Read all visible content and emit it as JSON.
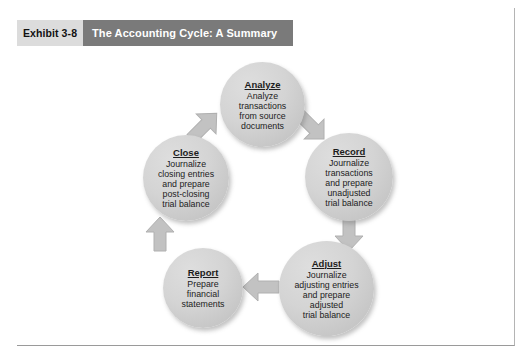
{
  "header": {
    "exhibit_label": "Exhibit 3-8",
    "title": "The Accounting Cycle: A Summary"
  },
  "colors": {
    "header_bar": "#7a7a7a",
    "exhibit_tag": "#dcdcdc",
    "circle_fill": "#d4d4d4",
    "arrow_fill": "#c0c0c0",
    "text": "#1c1c1c",
    "header_text": "#ffffff"
  },
  "diagram": {
    "type": "cycle",
    "nodes": [
      {
        "id": "analyze",
        "title": "Analyze",
        "body": "Analyze\ntransactions\nfrom source\ndocuments"
      },
      {
        "id": "record",
        "title": "Record",
        "body": "Journalize\ntransactions\nand prepare\nunadjusted\ntrial balance"
      },
      {
        "id": "adjust",
        "title": "Adjust",
        "body": "Journalize\nadjusting entries\nand prepare\nadjusted\ntrial balance"
      },
      {
        "id": "report",
        "title": "Report",
        "body": "Prepare\nfinancial\nstatements"
      },
      {
        "id": "close",
        "title": "Close",
        "body": "Journalize\nclosing entries\nand prepare\npost-closing\ntrial balance"
      }
    ],
    "arrows": [
      {
        "id": "analyze-to-record",
        "from": "analyze",
        "to": "record",
        "direction": "down-right"
      },
      {
        "id": "record-to-adjust",
        "from": "record",
        "to": "adjust",
        "direction": "down"
      },
      {
        "id": "adjust-to-report",
        "from": "adjust",
        "to": "report",
        "direction": "left"
      },
      {
        "id": "report-to-close",
        "from": "report",
        "to": "close",
        "direction": "up"
      },
      {
        "id": "close-to-analyze",
        "from": "close",
        "to": "analyze",
        "direction": "up-right"
      }
    ]
  }
}
